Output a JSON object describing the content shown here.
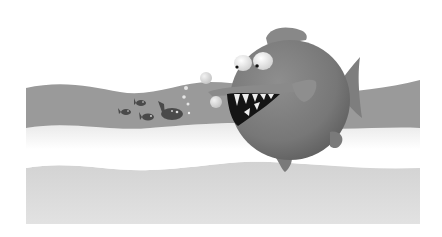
{
  "illustration": {
    "description": "Cartoon piranha with sharp teeth chasing a school of small fish through wavy water bands",
    "colors": {
      "background": "#ffffff",
      "upper_wave": "#9a9a9a",
      "middle_band_top": "#e6e6e6",
      "middle_band_bottom": "#ffffff",
      "lower_wave": "#d4d4d4",
      "piranha_body": "#7d7d7d",
      "piranha_dark": "#5e5e5e",
      "piranha_fin": "#8a8a8a",
      "mouth": "#141414",
      "teeth": "#eeeeee",
      "eye_white": "#f2f2f2",
      "pupil": "#111111",
      "small_fish": "#4a4a4a",
      "bubble": "#dcdcdc"
    },
    "elements": {
      "piranha": "big round fish with open toothy mouth",
      "small_fish_count": 4,
      "bubbles_count": 6
    }
  }
}
